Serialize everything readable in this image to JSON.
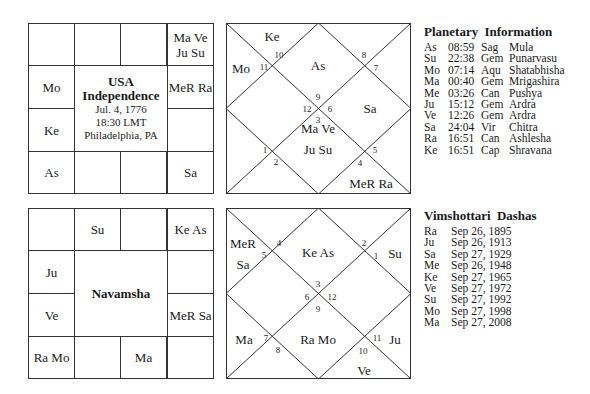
{
  "rasi_south": {
    "center": {
      "title_line1": "USA",
      "title_line2": "Independence",
      "date": "Jul. 4, 1776",
      "time": "18:30 LMT",
      "place": "Philadelphia, PA"
    },
    "cells": {
      "r0c0": "",
      "r0c1": "",
      "r0c2": "",
      "r0c3": "Ma Ve Ju Su",
      "r1c0": "Mo",
      "r1c3": "MeR Ra",
      "r2c0": "Ke",
      "r2c3": "",
      "r3c0": "As",
      "r3c1": "",
      "r3c2": "",
      "r3c3": "Sa"
    }
  },
  "rasi_north": {
    "houses": {
      "h1": "As",
      "h2": "Ke",
      "h3": "Mo",
      "h4": "",
      "h5": "",
      "h6": "",
      "h7": "Ma Ve",
      "h7b": "Ju Su",
      "h8": "MeR Ra",
      "h9": "",
      "h10": "Sa",
      "h11": "",
      "h12": ""
    },
    "signs": [
      "9",
      "10",
      "11",
      "12",
      "1",
      "2",
      "3",
      "4",
      "5",
      "6",
      "7",
      "8"
    ]
  },
  "planetary_info": {
    "title": "Planetary Information",
    "rows": [
      {
        "planet": "As",
        "degree": "08:59",
        "sign": "Sag",
        "nakshatra": "Mula"
      },
      {
        "planet": "Su",
        "degree": "22:38",
        "sign": "Gem",
        "nakshatra": "Punarvasu"
      },
      {
        "planet": "Mo",
        "degree": "07:14",
        "sign": "Aqu",
        "nakshatra": "Shatabhisha"
      },
      {
        "planet": "Ma",
        "degree": "00:40",
        "sign": "Gem",
        "nakshatra": "Mrigashira"
      },
      {
        "planet": "Me",
        "degree": "03:26",
        "sign": "Can",
        "nakshatra": "Pushya"
      },
      {
        "planet": "Ju",
        "degree": "15:12",
        "sign": "Gem",
        "nakshatra": "Ardra"
      },
      {
        "planet": "Ve",
        "degree": "12:26",
        "sign": "Gem",
        "nakshatra": "Ardra"
      },
      {
        "planet": "Sa",
        "degree": "24:04",
        "sign": "Vir",
        "nakshatra": "Chitra"
      },
      {
        "planet": "Ra",
        "degree": "16:51",
        "sign": "Can",
        "nakshatra": "Ashlesha"
      },
      {
        "planet": "Ke",
        "degree": "16:51",
        "sign": "Cap",
        "nakshatra": "Shravana"
      }
    ]
  },
  "navamsha_south": {
    "center": {
      "title": "Navamsha"
    },
    "cells": {
      "r0c0": "",
      "r0c1": "Su",
      "r0c2": "",
      "r0c3": "Ke As",
      "r1c0": "Ju",
      "r1c3": "",
      "r2c0": "Ve",
      "r2c3": "MeR Sa",
      "r3c0": "Ra Mo",
      "r3c1": "",
      "r3c2": "Ma",
      "r3c3": ""
    }
  },
  "navamsha_north": {
    "houses": {
      "h1": "Ke As",
      "h2": "MeR",
      "h2b": "Sa",
      "h3": "",
      "h4": "",
      "h5": "Ma",
      "h6": "",
      "h7": "Ra Mo",
      "h8": "Ve",
      "h9": "Ju",
      "h10": "",
      "h11": "Su",
      "h12": ""
    },
    "signs": [
      "3",
      "4",
      "5",
      "6",
      "7",
      "8",
      "9",
      "10",
      "11",
      "12",
      "1",
      "2"
    ]
  },
  "dashas": {
    "title": "Vimshottari Dashas",
    "rows": [
      {
        "planet": "Ra",
        "date": "Sep 26, 1895"
      },
      {
        "planet": "Ju",
        "date": "Sep 26, 1913"
      },
      {
        "planet": "Sa",
        "date": "Sep 27, 1929"
      },
      {
        "planet": "Me",
        "date": "Sep 26, 1948"
      },
      {
        "planet": "Ke",
        "date": "Sep 27, 1965"
      },
      {
        "planet": "Ve",
        "date": "Sep 27, 1972"
      },
      {
        "planet": "Su",
        "date": "Sep 27, 1992"
      },
      {
        "planet": "Mo",
        "date": "Sep 27, 1998"
      },
      {
        "planet": "Ma",
        "date": "Sep 27, 2008"
      }
    ]
  }
}
